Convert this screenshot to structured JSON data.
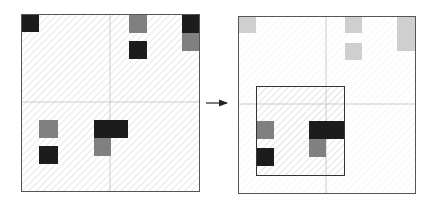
{
  "diagram": {
    "colors": {
      "dark": "#1c1c1c",
      "mid": "#808080",
      "light": "#cfcfcf",
      "frame": "#555555",
      "hatch": "#d6d6d6",
      "crosshair": "#cccccc",
      "arrow": "#222222"
    },
    "left_panel": {
      "frame": [
        21,
        14,
        178,
        177
      ],
      "crosshair": {
        "x": 110,
        "y": 102
      },
      "cells": [
        {
          "x": 21,
          "y": 14,
          "w": 18,
          "h": 18,
          "tone": "dark"
        },
        {
          "x": 129,
          "y": 15,
          "w": 18,
          "h": 18,
          "tone": "mid"
        },
        {
          "x": 129,
          "y": 41,
          "w": 18,
          "h": 18,
          "tone": "dark"
        },
        {
          "x": 182,
          "y": 15,
          "w": 17,
          "h": 18,
          "tone": "dark"
        },
        {
          "x": 182,
          "y": 33,
          "w": 17,
          "h": 18,
          "tone": "mid"
        },
        {
          "x": 39,
          "y": 120,
          "w": 19,
          "h": 18,
          "tone": "mid"
        },
        {
          "x": 39,
          "y": 146,
          "w": 19,
          "h": 18,
          "tone": "dark"
        },
        {
          "x": 94,
          "y": 120,
          "w": 34,
          "h": 18,
          "tone": "dark"
        },
        {
          "x": 94,
          "y": 138,
          "w": 17,
          "h": 18,
          "tone": "mid"
        }
      ]
    },
    "arrow": {
      "x1": 206,
      "y1": 103,
      "x2": 229,
      "y2": 103
    },
    "right_panel": {
      "frame": [
        238,
        16,
        177,
        177
      ],
      "crosshair": {
        "x": 326,
        "y": 104
      },
      "crop_box": [
        256,
        86,
        88,
        89
      ],
      "cells": [
        {
          "x": 238,
          "y": 16,
          "w": 18,
          "h": 17,
          "tone": "light"
        },
        {
          "x": 345,
          "y": 16,
          "w": 17,
          "h": 17,
          "tone": "light"
        },
        {
          "x": 345,
          "y": 43,
          "w": 17,
          "h": 17,
          "tone": "light"
        },
        {
          "x": 397,
          "y": 16,
          "w": 18,
          "h": 35,
          "tone": "light"
        },
        {
          "x": 256,
          "y": 121,
          "w": 18,
          "h": 18,
          "tone": "mid"
        },
        {
          "x": 256,
          "y": 148,
          "w": 18,
          "h": 18,
          "tone": "dark"
        },
        {
          "x": 309,
          "y": 121,
          "w": 35,
          "h": 18,
          "tone": "dark"
        },
        {
          "x": 309,
          "y": 139,
          "w": 17,
          "h": 18,
          "tone": "mid"
        }
      ]
    }
  }
}
